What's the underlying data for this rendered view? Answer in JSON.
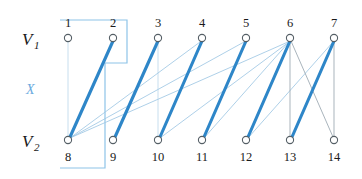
{
  "figure": {
    "width": 362,
    "height": 179,
    "background_color": "#ffffff"
  },
  "labels": {
    "v1_letter": "V",
    "v1_subscript": "1",
    "v2_letter": "V",
    "v2_subscript": "2",
    "set_x": "X"
  },
  "colors": {
    "matching_edge": "#2e86c8",
    "light_edge": "#9fc7e4",
    "faint_edge": "#b9d6ea",
    "grey_edge": "#9aa7b0",
    "outline": "#8ec4e8",
    "node_stroke": "#555f66",
    "node_fill": "#ffffff",
    "text": "#1a1a1a",
    "set_label": "#6aaade"
  },
  "geometry": {
    "top_row_y": 38,
    "bottom_row_y": 140,
    "node_radius": 3.6,
    "top_number_y": 24,
    "bottom_number_y": 159,
    "columns_x": [
      68,
      113,
      158,
      202,
      246,
      290,
      334
    ]
  },
  "nodes": {
    "top_row": [
      {
        "id": "1",
        "label": "1",
        "x": 68,
        "y": 38
      },
      {
        "id": "2",
        "label": "2",
        "x": 113,
        "y": 38
      },
      {
        "id": "3",
        "label": "3",
        "x": 158,
        "y": 38
      },
      {
        "id": "4",
        "label": "4",
        "x": 202,
        "y": 38
      },
      {
        "id": "5",
        "label": "5",
        "x": 246,
        "y": 38
      },
      {
        "id": "6",
        "label": "6",
        "x": 290,
        "y": 38
      },
      {
        "id": "7",
        "label": "7",
        "x": 334,
        "y": 38
      }
    ],
    "bottom_row": [
      {
        "id": "8",
        "label": "8",
        "x": 68,
        "y": 140
      },
      {
        "id": "9",
        "label": "9",
        "x": 113,
        "y": 140
      },
      {
        "id": "10",
        "label": "10",
        "x": 158,
        "y": 140
      },
      {
        "id": "11",
        "label": "11",
        "x": 202,
        "y": 140
      },
      {
        "id": "12",
        "label": "12",
        "x": 246,
        "y": 140
      },
      {
        "id": "13",
        "label": "13",
        "x": 290,
        "y": 140
      },
      {
        "id": "14",
        "label": "14",
        "x": 334,
        "y": 140
      }
    ]
  },
  "edges": {
    "matching": [
      {
        "from": "2",
        "to": "8",
        "x1": 113,
        "y1": 41,
        "x2": 70,
        "y2": 137
      },
      {
        "from": "3",
        "to": "9",
        "x1": 158,
        "y1": 41,
        "x2": 115,
        "y2": 137
      },
      {
        "from": "4",
        "to": "10",
        "x1": 202,
        "y1": 41,
        "x2": 160,
        "y2": 137
      },
      {
        "from": "5",
        "to": "11",
        "x1": 246,
        "y1": 41,
        "x2": 204,
        "y2": 137
      },
      {
        "from": "6",
        "to": "12",
        "x1": 290,
        "y1": 41,
        "x2": 248,
        "y2": 137
      },
      {
        "from": "7",
        "to": "13",
        "x1": 334,
        "y1": 41,
        "x2": 292,
        "y2": 137
      }
    ],
    "light": [
      {
        "from": "1",
        "to": "8",
        "x1": 68,
        "y1": 41,
        "x2": 68,
        "y2": 137
      },
      {
        "from": "3",
        "to": "10",
        "x1": 158,
        "y1": 41,
        "x2": 158,
        "y2": 137
      },
      {
        "from": "4",
        "to": "8",
        "x1": 200,
        "y1": 42,
        "x2": 70,
        "y2": 138
      },
      {
        "from": "5",
        "to": "8",
        "x1": 244,
        "y1": 42,
        "x2": 70,
        "y2": 138
      },
      {
        "from": "6",
        "to": "8",
        "x1": 288,
        "y1": 42,
        "x2": 70,
        "y2": 138
      },
      {
        "from": "6",
        "to": "10",
        "x1": 289,
        "y1": 42,
        "x2": 160,
        "y2": 138
      },
      {
        "from": "6",
        "to": "11",
        "x1": 289,
        "y1": 42,
        "x2": 204,
        "y2": 138
      },
      {
        "from": "6",
        "to": "12",
        "x1": 289,
        "y1": 42,
        "x2": 247,
        "y2": 138
      },
      {
        "from": "7",
        "to": "12",
        "x1": 333,
        "y1": 42,
        "x2": 248,
        "y2": 138
      }
    ],
    "grey": [
      {
        "from": "6",
        "to": "13",
        "x1": 290,
        "y1": 41,
        "x2": 290,
        "y2": 137
      },
      {
        "from": "6",
        "to": "14",
        "x1": 291,
        "y1": 41,
        "x2": 333,
        "y2": 137
      },
      {
        "from": "7",
        "to": "14",
        "x1": 334,
        "y1": 41,
        "x2": 334,
        "y2": 137
      }
    ]
  },
  "selection": {
    "name": "set-X-outline",
    "points": "60,20 127,20 127,63 105,63 105,168 60,168"
  }
}
